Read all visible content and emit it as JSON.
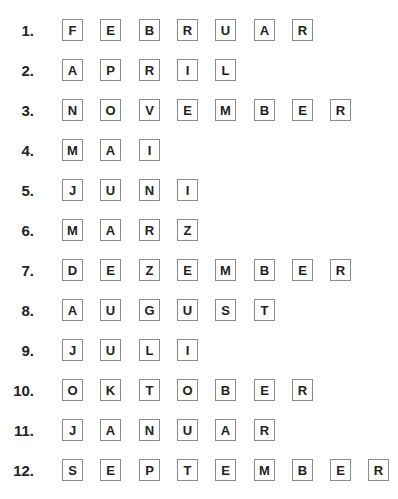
{
  "rows": [
    {
      "number": "1.",
      "letters": [
        "F",
        "E",
        "B",
        "R",
        "U",
        "A",
        "R"
      ]
    },
    {
      "number": "2.",
      "letters": [
        "A",
        "P",
        "R",
        "I",
        "L"
      ]
    },
    {
      "number": "3.",
      "letters": [
        "N",
        "O",
        "V",
        "E",
        "M",
        "B",
        "E",
        "R"
      ]
    },
    {
      "number": "4.",
      "letters": [
        "M",
        "A",
        "I"
      ]
    },
    {
      "number": "5.",
      "letters": [
        "J",
        "U",
        "N",
        "I"
      ]
    },
    {
      "number": "6.",
      "letters": [
        "M",
        "A",
        "R",
        "Z"
      ]
    },
    {
      "number": "7.",
      "letters": [
        "D",
        "E",
        "Z",
        "E",
        "M",
        "B",
        "E",
        "R"
      ]
    },
    {
      "number": "8.",
      "letters": [
        "A",
        "U",
        "G",
        "U",
        "S",
        "T"
      ]
    },
    {
      "number": "9.",
      "letters": [
        "J",
        "U",
        "L",
        "I"
      ]
    },
    {
      "number": "10.",
      "letters": [
        "O",
        "K",
        "T",
        "O",
        "B",
        "E",
        "R"
      ]
    },
    {
      "number": "11.",
      "letters": [
        "J",
        "A",
        "N",
        "U",
        "A",
        "R"
      ]
    },
    {
      "number": "12.",
      "letters": [
        "S",
        "E",
        "P",
        "T",
        "E",
        "M",
        "B",
        "E",
        "R"
      ]
    }
  ]
}
